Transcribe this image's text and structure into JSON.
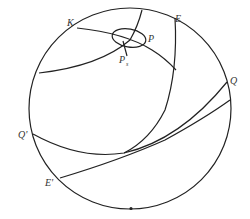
{
  "diagram": {
    "type": "celestial-sphere",
    "colors": {
      "line": "#222222",
      "label": "#333333",
      "background": "#ffffff"
    },
    "labels": {
      "K": "K",
      "E": "E",
      "P": "P",
      "Ps_main": "P",
      "Ps_sub": "s",
      "Q": "Q",
      "Q_prime": "Q'",
      "E_prime": "E'"
    }
  }
}
